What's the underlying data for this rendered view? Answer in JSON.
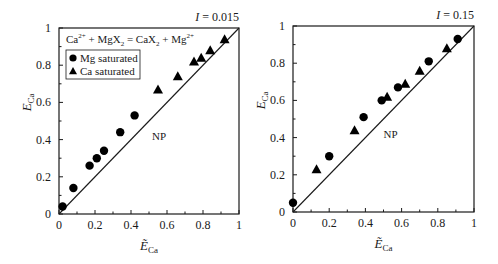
{
  "figure": {
    "equation": {
      "parts": [
        "Ca",
        "2+",
        " + MgX",
        "2",
        " = CaX",
        "2",
        " + Mg",
        "2+"
      ]
    },
    "legend": {
      "items": [
        {
          "label": "Mg saturated",
          "marker": "circle"
        },
        {
          "label": "Ca saturated",
          "marker": "triangle"
        }
      ]
    },
    "np_label": "NP"
  },
  "chart_data": [
    {
      "type": "scatter",
      "title": "I = 0.015",
      "title_parts": {
        "var": "I",
        "value": " = 0.015"
      },
      "xlabel": "Ẽ_Ca",
      "ylabel": "E_Ca",
      "xlim": [
        0,
        1
      ],
      "ylim": [
        0,
        1
      ],
      "xticks": [
        "0",
        "0.2",
        "0.4",
        "0.6",
        "0.8",
        "1"
      ],
      "yticks": [
        "0",
        "0.2",
        "0.4",
        "0.6",
        "0.8",
        "1"
      ],
      "grid": false,
      "legend_position": "upper left",
      "reference_line": {
        "x": [
          0,
          1
        ],
        "y": [
          0,
          1
        ]
      },
      "annotations": [
        "Ca2+ + MgX2 = CaX2 + Mg2+",
        "NP"
      ],
      "series": [
        {
          "name": "Mg saturated",
          "marker": "circle",
          "x": [
            0.02,
            0.08,
            0.17,
            0.21,
            0.25,
            0.34,
            0.42
          ],
          "y": [
            0.04,
            0.14,
            0.26,
            0.3,
            0.34,
            0.44,
            0.53
          ]
        },
        {
          "name": "Ca saturated",
          "marker": "triangle",
          "x": [
            0.55,
            0.66,
            0.75,
            0.79,
            0.84,
            0.92
          ],
          "y": [
            0.67,
            0.74,
            0.82,
            0.84,
            0.88,
            0.94
          ]
        }
      ],
      "frame": {
        "x0": 59,
        "y0": 28,
        "x1": 239,
        "y1": 214
      }
    },
    {
      "type": "scatter",
      "title": "I = 0.15",
      "title_parts": {
        "var": "I",
        "value": " = 0.15"
      },
      "xlabel": "Ẽ_Ca",
      "ylabel": "E_Ca",
      "xlim": [
        0,
        1
      ],
      "ylim": [
        0,
        1
      ],
      "xticks": [
        "0",
        "0.2",
        "0.4",
        "0.6",
        "0.8",
        "1"
      ],
      "yticks": [
        "0",
        "0.2",
        "0.4",
        "0.6",
        "0.8",
        "1"
      ],
      "grid": false,
      "reference_line": {
        "x": [
          0,
          1
        ],
        "y": [
          0,
          1
        ]
      },
      "annotations": [
        "NP"
      ],
      "series": [
        {
          "name": "Mg saturated",
          "marker": "circle",
          "x": [
            0.0,
            0.2,
            0.39,
            0.49,
            0.58,
            0.75,
            0.91
          ],
          "y": [
            0.05,
            0.3,
            0.51,
            0.6,
            0.67,
            0.81,
            0.93
          ]
        },
        {
          "name": "Ca saturated",
          "marker": "triangle",
          "x": [
            0.13,
            0.34,
            0.52,
            0.62,
            0.7,
            0.85
          ],
          "y": [
            0.23,
            0.44,
            0.62,
            0.69,
            0.76,
            0.88
          ]
        }
      ],
      "frame": {
        "x0": 293,
        "y0": 26,
        "x1": 474,
        "y1": 212
      }
    }
  ]
}
